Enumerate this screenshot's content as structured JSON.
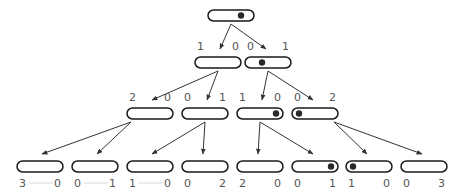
{
  "diagram": {
    "type": "tree",
    "levels": [
      {
        "nodes": [
          {
            "id": "n0",
            "dot": "right",
            "labels": [
              "",
              ""
            ]
          }
        ]
      },
      {
        "nodes": [
          {
            "id": "n1a",
            "dot": "none",
            "labels": [
              "1",
              "0"
            ],
            "parent": "n0"
          },
          {
            "id": "n1b",
            "dot": "center",
            "labels": [
              "0",
              "1"
            ],
            "parent": "n0"
          }
        ]
      },
      {
        "nodes": [
          {
            "id": "n2a",
            "dot": "none",
            "labels": [
              "2",
              "0"
            ],
            "parent": "n1a"
          },
          {
            "id": "n2b",
            "dot": "none",
            "labels": [
              "0",
              "1"
            ],
            "parent": "n1a"
          },
          {
            "id": "n2c",
            "dot": "right",
            "labels": [
              "1",
              "0"
            ],
            "parent": "n1b"
          },
          {
            "id": "n2d",
            "dot": "left",
            "labels": [
              "0",
              "2"
            ],
            "parent": "n1b"
          }
        ]
      },
      {
        "nodes": [
          {
            "id": "n3a",
            "dot": "none",
            "labels": [
              "3",
              "0"
            ],
            "parent": "n2a"
          },
          {
            "id": "n3b",
            "dot": "none",
            "labels": [
              "0",
              "1"
            ],
            "parent": "n2a"
          },
          {
            "id": "n3c",
            "dot": "none",
            "labels": [
              "1",
              "0"
            ],
            "parent": "n2b"
          },
          {
            "id": "n3d",
            "dot": "none",
            "labels": [
              "0",
              "2"
            ],
            "parent": "n2b"
          },
          {
            "id": "n3e",
            "dot": "none",
            "labels": [
              "2",
              "0"
            ],
            "parent": "n2c"
          },
          {
            "id": "n3f",
            "dot": "right",
            "labels": [
              "0",
              "1"
            ],
            "parent": "n2c"
          },
          {
            "id": "n3g",
            "dot": "left",
            "labels": [
              "1",
              "0"
            ],
            "parent": "n2d"
          },
          {
            "id": "n3h",
            "dot": "none",
            "labels": [
              "0",
              "3"
            ],
            "parent": "n2d"
          }
        ]
      }
    ]
  },
  "colors": {
    "stroke": "#1a1a1a",
    "dot": "#2a2a2a",
    "label": "#555555",
    "edge": "#333333"
  }
}
